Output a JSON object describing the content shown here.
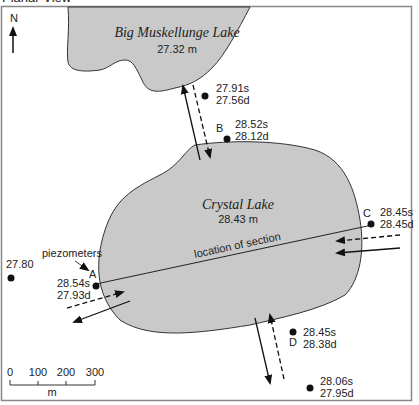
{
  "header": {
    "title": "Planar View"
  },
  "north": {
    "label": "N"
  },
  "lakes": [
    {
      "name": "Big Muskellunge Lake",
      "level": "27.32 m"
    },
    {
      "name": "Crystal Lake",
      "level": "28.43 m"
    }
  ],
  "section_line": {
    "label": "location of section"
  },
  "piezometer_callout": {
    "label": "piezometers"
  },
  "piezometers": [
    {
      "id": "",
      "shallow": "27.91s",
      "deep": "27.56d"
    },
    {
      "id": "B",
      "shallow": "28.52s",
      "deep": "28.12d"
    },
    {
      "id": "C",
      "shallow": "28.45s",
      "deep": "28.45d"
    },
    {
      "id": "A",
      "shallow": "28.54s",
      "deep": "27.93d"
    },
    {
      "id": "D",
      "shallow": "28.45s",
      "deep": "28.38d"
    },
    {
      "id": "",
      "shallow": "28.06s",
      "deep": "27.95d"
    },
    {
      "id": "",
      "single": "27.80"
    }
  ],
  "scale_bar": {
    "ticks": [
      "0",
      "100",
      "200",
      "300"
    ],
    "unit": "m"
  },
  "colors": {
    "lake_fill": "#c9c9c9",
    "outline": "#333333",
    "frame": "#888888"
  }
}
